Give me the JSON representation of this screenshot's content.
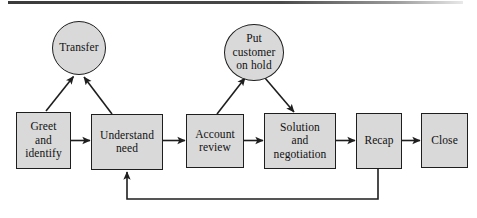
{
  "diagram": {
    "title_rule": "",
    "type": "process-flowchart",
    "fill_color": "#d9d9d9",
    "stroke_color": "#1e1e1e",
    "text_color": "#111111",
    "nodes": [
      {
        "id": "transfer",
        "shape": "circle",
        "label": "Transfer"
      },
      {
        "id": "put_on_hold",
        "shape": "circle",
        "label": "Put\ncustomer\non hold"
      },
      {
        "id": "greet",
        "shape": "rectangle",
        "label": "Greet\nand\nidentify"
      },
      {
        "id": "understand",
        "shape": "rectangle",
        "label": "Understand\nneed"
      },
      {
        "id": "account",
        "shape": "rectangle",
        "label": "Account\nreview"
      },
      {
        "id": "solution",
        "shape": "rectangle",
        "label": "Solution\nand\nnegotiation"
      },
      {
        "id": "recap",
        "shape": "rectangle",
        "label": "Recap"
      },
      {
        "id": "close",
        "shape": "rectangle",
        "label": "Close"
      }
    ],
    "edges": [
      {
        "from": "greet",
        "to": "understand",
        "style": "straight-arrow"
      },
      {
        "from": "understand",
        "to": "account",
        "style": "straight-arrow"
      },
      {
        "from": "account",
        "to": "solution",
        "style": "straight-arrow"
      },
      {
        "from": "solution",
        "to": "recap",
        "style": "straight-arrow"
      },
      {
        "from": "recap",
        "to": "close",
        "style": "straight-arrow"
      },
      {
        "from": "greet",
        "to": "transfer",
        "style": "diagonal-arrow"
      },
      {
        "from": "understand",
        "to": "transfer",
        "style": "diagonal-arrow"
      },
      {
        "from": "account",
        "to": "put_on_hold",
        "style": "diagonal-arrow"
      },
      {
        "from": "put_on_hold",
        "to": "solution",
        "style": "diagonal-arrow"
      },
      {
        "from": "recap",
        "to": "understand",
        "style": "feedback-loop"
      }
    ]
  }
}
